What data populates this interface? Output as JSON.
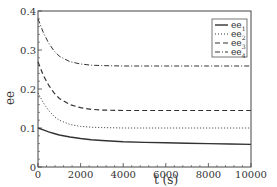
{
  "chart_data": {
    "type": "line",
    "title": "",
    "xlabel": "t (s)",
    "ylabel": "ee",
    "xlim": [
      0,
      10000
    ],
    "ylim": [
      0,
      0.4
    ],
    "xticks": [
      "0",
      "2000",
      "4000",
      "6000",
      "8000",
      "10000"
    ],
    "yticks": [
      "0",
      "0.1",
      "0.2",
      "0.3",
      "0.4"
    ],
    "grid": false,
    "legend_position": "upper right",
    "x": [
      0,
      250,
      500,
      750,
      1000,
      1500,
      2000,
      2500,
      3000,
      4000,
      5000,
      6000,
      7000,
      8000,
      9000,
      10000
    ],
    "series": [
      {
        "name": "ee1",
        "label_base": "ee",
        "label_sub": "1",
        "style": "solid",
        "values": [
          0.1,
          0.095,
          0.09,
          0.086,
          0.082,
          0.077,
          0.073,
          0.07,
          0.068,
          0.065,
          0.063,
          0.062,
          0.061,
          0.06,
          0.059,
          0.058
        ]
      },
      {
        "name": "ee2",
        "label_base": "ee",
        "label_sub": "2",
        "style": "dotted",
        "values": [
          0.19,
          0.165,
          0.145,
          0.13,
          0.12,
          0.109,
          0.104,
          0.102,
          0.101,
          0.1,
          0.1,
          0.1,
          0.1,
          0.1,
          0.1,
          0.1
        ]
      },
      {
        "name": "ee3",
        "label_base": "ee",
        "label_sub": "3",
        "style": "dashed",
        "values": [
          0.27,
          0.235,
          0.21,
          0.19,
          0.176,
          0.16,
          0.152,
          0.148,
          0.146,
          0.145,
          0.145,
          0.145,
          0.145,
          0.145,
          0.145,
          0.145
        ]
      },
      {
        "name": "ee4",
        "label_base": "ee",
        "label_sub": "4",
        "style": "dashdot",
        "values": [
          0.38,
          0.345,
          0.318,
          0.298,
          0.284,
          0.27,
          0.264,
          0.261,
          0.26,
          0.259,
          0.259,
          0.259,
          0.259,
          0.259,
          0.259,
          0.259
        ]
      }
    ]
  }
}
